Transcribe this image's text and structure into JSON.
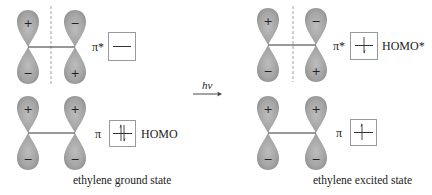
{
  "colors": {
    "lobe_fill": "#9a9a9a",
    "lobe_highlight": "#c4c4c4",
    "line": "#333333",
    "node_line": "#888888",
    "box_border": "#999999"
  },
  "ground_state": {
    "caption": "ethylene ground state",
    "pi_star": {
      "orbital_label": "π*",
      "left_lobe_signs": [
        "+",
        "−"
      ],
      "right_lobe_signs": [
        "−",
        "+"
      ],
      "has_node": true,
      "electrons": "empty",
      "state_label": ""
    },
    "pi": {
      "orbital_label": "π",
      "left_lobe_signs": [
        "+",
        "−"
      ],
      "right_lobe_signs": [
        "+",
        "−"
      ],
      "has_node": false,
      "electrons": "paired (↑↓)",
      "state_label": "HOMO"
    }
  },
  "transition": {
    "label": "hν",
    "arrow": "→"
  },
  "excited_state": {
    "caption": "ethylene excited state",
    "pi_star": {
      "orbital_label": "π*",
      "left_lobe_signs": [
        "+",
        "−"
      ],
      "right_lobe_signs": [
        "−",
        "+"
      ],
      "has_node": true,
      "electrons": "single (↓)",
      "state_label": "HOMO*"
    },
    "pi": {
      "orbital_label": "π",
      "left_lobe_signs": [
        "+",
        "−"
      ],
      "right_lobe_signs": [
        "+",
        "−"
      ],
      "has_node": false,
      "electrons": "single (↑)",
      "state_label": ""
    }
  }
}
